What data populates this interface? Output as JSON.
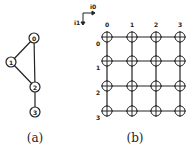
{
  "figure_a": {
    "caption": "(a)",
    "nodes": [
      {
        "id": "0",
        "x": 34,
        "y": 38
      },
      {
        "id": "1",
        "x": 11,
        "y": 62
      },
      {
        "id": "2",
        "x": 35,
        "y": 87
      },
      {
        "id": "3",
        "x": 35,
        "y": 112
      }
    ],
    "edges": [
      [
        "0",
        "1"
      ],
      [
        "0",
        "2"
      ],
      [
        "1",
        "2"
      ],
      [
        "2",
        "3"
      ]
    ]
  },
  "figure_b": {
    "caption": "(b)",
    "axis": {
      "horizontal_label": "i0",
      "vertical_label": "i1"
    },
    "column_labels": [
      "0",
      "1",
      "2",
      "3"
    ],
    "row_labels": [
      "0",
      "1",
      "2",
      "3"
    ],
    "grid_size": [
      4,
      4
    ]
  },
  "colors": {
    "stroke": "#222222",
    "background": "#ffffff"
  }
}
